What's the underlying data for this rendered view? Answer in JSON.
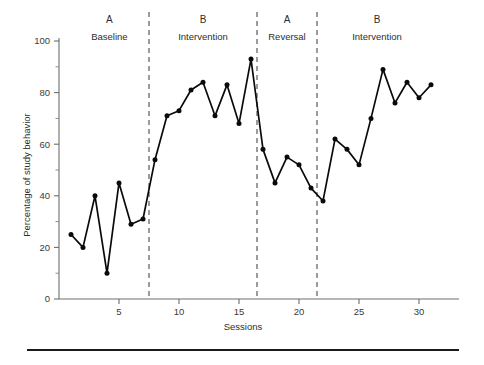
{
  "figure": {
    "bottom_rule": true,
    "line_color": "#0a0a0a",
    "axis_color": "#6e6e6e",
    "divider_color": "#4a4a4a"
  },
  "chart_data": {
    "type": "line",
    "title": "",
    "xlabel": "Sessions",
    "ylabel": "Percentage of study behavior",
    "xlim": [
      0,
      33
    ],
    "ylim": [
      0,
      100
    ],
    "grid": false,
    "legend": "none",
    "x_ticks": [
      5,
      10,
      15,
      20,
      25,
      30
    ],
    "x_minor_ticks": [],
    "y_ticks": [
      0,
      20,
      40,
      60,
      80,
      100
    ],
    "y_minor_ticks": [
      10,
      30,
      50,
      70,
      90
    ],
    "marker": "filled-circle",
    "x": [
      1,
      2,
      3,
      4,
      5,
      6,
      7,
      8,
      9,
      10,
      11,
      12,
      13,
      14,
      15,
      16,
      17,
      18,
      19,
      20,
      21,
      22,
      23,
      24,
      25,
      26,
      27,
      28,
      29,
      30,
      31
    ],
    "values": [
      25,
      20,
      40,
      10,
      45,
      29,
      31,
      54,
      71,
      73,
      81,
      84,
      71,
      83,
      68,
      93,
      58,
      45,
      55,
      52,
      43,
      38,
      62,
      58,
      52,
      70,
      89,
      76,
      84,
      78,
      83
    ],
    "segments": [
      {
        "phase": "A",
        "label": "Baseline",
        "x": [
          1,
          2,
          3,
          4,
          5,
          6,
          7
        ],
        "values": [
          25,
          20,
          40,
          10,
          45,
          29,
          31
        ]
      },
      {
        "phase": "B",
        "label": "Intervention",
        "x": [
          8,
          9,
          10,
          11,
          12,
          13,
          14,
          15,
          16
        ],
        "values": [
          54,
          71,
          73,
          81,
          84,
          71,
          83,
          68,
          93
        ]
      },
      {
        "phase": "A",
        "label": "Reversal",
        "x": [
          17,
          18,
          19,
          20,
          21
        ],
        "values": [
          58,
          45,
          55,
          52,
          43
        ]
      },
      {
        "phase": "B",
        "label": "Intervention",
        "x": [
          22,
          23,
          24,
          25,
          26,
          27,
          28,
          29,
          30,
          31
        ],
        "values": [
          38,
          62,
          58,
          52,
          70,
          89,
          76,
          84,
          78,
          83
        ]
      }
    ],
    "phase_dividers": [
      7.5,
      16.5,
      21.5
    ],
    "annotations": [
      {
        "letter": "A",
        "name": "Baseline",
        "x_center": 4.2
      },
      {
        "letter": "B",
        "name": "Intervention",
        "x_center": 12.0
      },
      {
        "letter": "A",
        "name": "Reversal",
        "x_center": 19.0
      },
      {
        "letter": "B",
        "name": "Intervention",
        "x_center": 26.5
      }
    ]
  },
  "axis": {
    "y_label": "Percentage of study behavior",
    "x_label": "Sessions",
    "y_tick_labels": [
      "0",
      "20",
      "40",
      "60",
      "80",
      "100"
    ],
    "x_tick_labels": [
      "5",
      "10",
      "15",
      "20",
      "25",
      "30"
    ]
  }
}
